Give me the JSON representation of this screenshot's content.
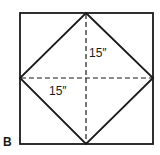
{
  "figure": {
    "panel_label": "B",
    "dimensions": [
      {
        "id": "vertical",
        "label": "15″"
      },
      {
        "id": "horizontal",
        "label": "15″"
      }
    ],
    "colors": {
      "stroke": "#1a1a1a",
      "background": "#ffffff"
    }
  }
}
